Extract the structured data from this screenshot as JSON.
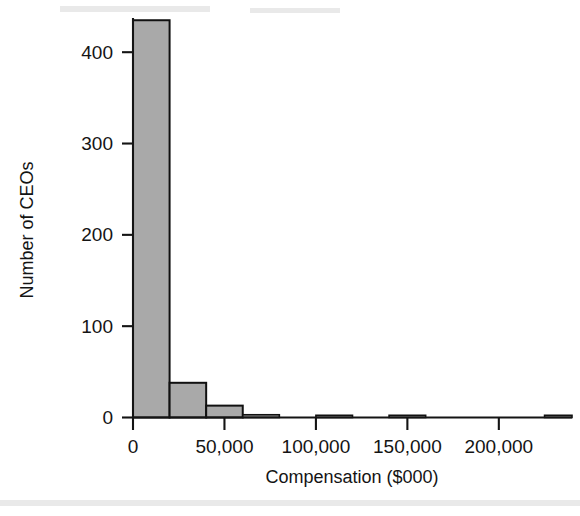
{
  "chart_data": {
    "type": "bar",
    "title": "",
    "subtitle": "",
    "xlabel": "Compensation ($000)",
    "ylabel": "Number of CEOs",
    "grid": false,
    "legend": null,
    "xlim": [
      0,
      240000
    ],
    "ylim": [
      0,
      450
    ],
    "bin_width": 20000,
    "x_ticks": [
      0,
      50000,
      100000,
      150000,
      200000
    ],
    "x_tick_labels": [
      "0",
      "50,000",
      "100,000",
      "150,000",
      "200,000"
    ],
    "y_ticks": [
      0,
      100,
      200,
      300,
      400
    ],
    "y_tick_labels": [
      "0",
      "100",
      "200",
      "300",
      "400"
    ],
    "categories": [
      "0-20,000",
      "20,000-40,000",
      "40,000-60,000",
      "60,000-80,000",
      "100,000-120,000",
      "140,000-160,000",
      "225,000-240,000"
    ],
    "bin_starts": [
      0,
      20000,
      40000,
      60000,
      100000,
      140000,
      225000
    ],
    "bin_ends": [
      20000,
      40000,
      60000,
      80000,
      120000,
      160000,
      240000
    ],
    "values": [
      435,
      38,
      13,
      3,
      2,
      1,
      1
    ],
    "bar_fill_color": "#a9a9a9",
    "bar_edge_color": "#111111"
  },
  "axes": {
    "x_title": "Compensation ($000)",
    "y_title": "Number of CEOs"
  }
}
